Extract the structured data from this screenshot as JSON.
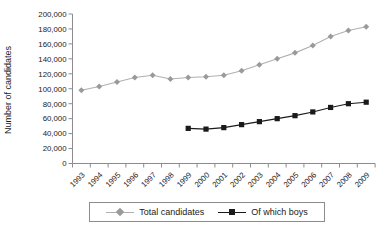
{
  "chart_data": {
    "type": "line",
    "title": "",
    "xlabel": "",
    "ylabel": "Number of candidates",
    "ylim": [
      0,
      200000
    ],
    "ytick_step": 20000,
    "ytick_labels": [
      "0",
      "20,000",
      "40,000",
      "60,000",
      "80,000",
      "100,000",
      "120,000",
      "140,000",
      "160,000",
      "180,000",
      "200,000"
    ],
    "categories": [
      "1993",
      "1994",
      "1995",
      "1996",
      "1997",
      "1998",
      "1999",
      "2000",
      "2001",
      "2002",
      "2003",
      "2004",
      "2005",
      "2006",
      "2007",
      "2008",
      "2009"
    ],
    "series": [
      {
        "name": "Total candidates",
        "marker": "diamond",
        "line_color": "#b0b0b0",
        "marker_color": "#9a9a9a",
        "values": [
          98000,
          103000,
          109000,
          115000,
          118000,
          113000,
          115000,
          116000,
          118000,
          124000,
          132000,
          140000,
          148000,
          158000,
          170000,
          178000,
          183000
        ]
      },
      {
        "name": "Of which boys",
        "marker": "square",
        "line_color": "#1a1a1a",
        "marker_color": "#1a1a1a",
        "values": [
          null,
          null,
          null,
          null,
          null,
          null,
          47000,
          46000,
          48000,
          52000,
          56000,
          60000,
          64000,
          69000,
          75000,
          80000,
          82000
        ]
      }
    ],
    "legend_position": "bottom",
    "grid": "off",
    "colors": {
      "axis": "#8c8c8c",
      "text": "#1a1a1a",
      "background": "#ffffff"
    }
  }
}
